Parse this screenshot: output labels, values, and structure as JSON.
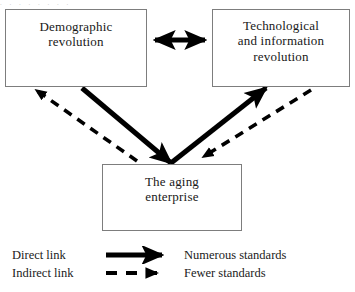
{
  "figure": {
    "type": "flow-diagram",
    "background_color": "#ffffff",
    "line_color": "#000000",
    "box_border_color": "#7d7d7d",
    "top_partial_artifact": ". . . . . . . ."
  },
  "nodes": {
    "demographic": {
      "id": "demographic-revolution",
      "label": "Demographic\nrevolution"
    },
    "technological": {
      "id": "technological-revolution",
      "label": "Technological\nand information\nrevolution"
    },
    "aging": {
      "id": "aging-enterprise",
      "label": "The aging\nenterprise"
    }
  },
  "edges": [
    {
      "id": "demographic-technological",
      "from": "demographic",
      "to": "technological",
      "style": "solid",
      "direction": "bidirectional",
      "meaning": "Direct link"
    },
    {
      "id": "demographic-to-aging",
      "from": "demographic",
      "to": "aging",
      "style": "solid",
      "direction": "forward",
      "meaning": "Direct link"
    },
    {
      "id": "aging-to-technological",
      "from": "aging",
      "to": "technological",
      "style": "solid",
      "direction": "forward",
      "meaning": "Direct link"
    },
    {
      "id": "aging-to-demographic",
      "from": "aging",
      "to": "demographic",
      "style": "dashed",
      "direction": "forward",
      "meaning": "Indirect link"
    },
    {
      "id": "technological-to-aging",
      "from": "technological",
      "to": "aging",
      "style": "dashed",
      "direction": "forward",
      "meaning": "Indirect link"
    }
  ],
  "legend": {
    "rows": [
      {
        "term": "Direct link",
        "glyph": "solid-arrow-icon",
        "description": "Numerous standards"
      },
      {
        "term": "Indirect link",
        "glyph": "dashed-arrow-icon",
        "description": "Fewer standards"
      }
    ]
  }
}
